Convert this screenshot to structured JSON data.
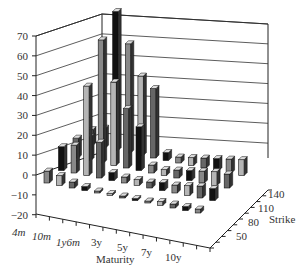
{
  "chart_data": {
    "type": "bar",
    "subtype": "3d-bar",
    "title": "",
    "xlabel": "Maturity",
    "ylabel": "",
    "zlabel": "Strike",
    "ylim": [
      -20,
      70
    ],
    "y_ticks": [
      70,
      60,
      50,
      40,
      30,
      20,
      10,
      0,
      -10,
      -20
    ],
    "x_tick_labels": [
      "4m",
      "10m",
      "1y6m",
      "3y",
      "5y",
      "7y",
      "10y"
    ],
    "z_tick_labels": [
      "140",
      "110",
      "80",
      "50"
    ],
    "grid": true,
    "legend": null,
    "categories_maturity": [
      "4m",
      "6m",
      "10m",
      "1y",
      "1y6m",
      "2y",
      "3y",
      "4y",
      "5y",
      "6y",
      "7y",
      "8y",
      "10y"
    ],
    "categories_strike": [
      "50",
      "80",
      "110",
      "140"
    ],
    "series": [
      {
        "name": "Strike 140 (back row)",
        "values": [
          8,
          10,
          70,
          55,
          40,
          35,
          4,
          3,
          4,
          5,
          6,
          7,
          8
        ]
      },
      {
        "name": "Strike 110",
        "values": [
          10,
          12,
          62,
          42,
          30,
          22,
          4,
          3,
          4,
          5,
          6,
          7,
          7
        ]
      },
      {
        "name": "Strike 80",
        "values": [
          12,
          14,
          45,
          18,
          4,
          3,
          3,
          3,
          4,
          4,
          5,
          6,
          6
        ]
      },
      {
        "name": "Strike 50 (front row)",
        "values": [
          6,
          5,
          3,
          2,
          1,
          1,
          1,
          1,
          1,
          2,
          2,
          2,
          2
        ]
      }
    ]
  },
  "labels": {
    "y_ticks": [
      "70",
      "60",
      "50",
      "40",
      "30",
      "20",
      "10",
      "0",
      "−10",
      "−20"
    ],
    "x_ticks": [
      "4m",
      "10m",
      "1y6m",
      "3y",
      "5y",
      "7y",
      "10y"
    ],
    "z_ticks": [
      "140",
      "110",
      "80",
      "50"
    ],
    "x_title": "Maturity",
    "z_title": "Strike"
  }
}
